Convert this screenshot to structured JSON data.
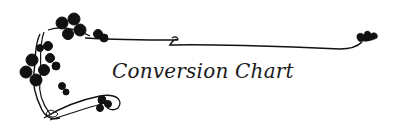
{
  "banner": {
    "title": "Conversion Chart",
    "ornament": "clover-vine-flourish-icon",
    "colors": {
      "ink": "#111111",
      "background": "#ffffff"
    }
  }
}
